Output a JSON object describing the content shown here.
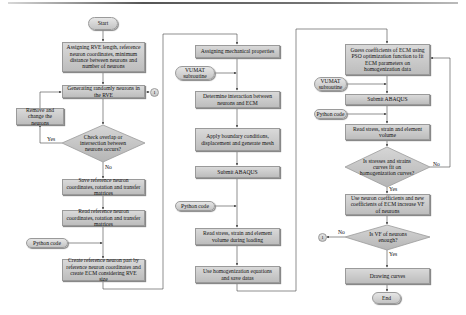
{
  "flowchart": {
    "column1": {
      "start": "Start",
      "assign_rve": "Assigning RVE length, reference neuron coordinates, minimum distance between neurons and number of neurons",
      "generate": "Generating randomly neurons in the RVE",
      "connector_out": "1",
      "remove_change": "Remove and change the neurons",
      "check_overlap": "Check overlap or intersection between neurons occurs?",
      "yes_label": "Yes",
      "no_label": "No",
      "save_ref": "Save reference neuron coordinates, rotation and transfer matrices",
      "read_ref": "Read reference neuron coordinates, rotation and transfer matrices",
      "python_code": "Python code",
      "create_part": "Create reference neuron part by reference neuron coordinates and create ECM considering RVE size"
    },
    "column2": {
      "assign_mech": "Assigning mechanical properties",
      "vumat": "VUMAT subroutine",
      "interaction": "Determine interaction between neurons and ECM",
      "boundary": "Apply boundary conditions, displacement and generate mesh",
      "submit": "Submit ABAQUS",
      "python_code": "Python code",
      "read_stress": "Read stress, strain and element volume during loading",
      "homogenization": "Use homogenization equations and save datas"
    },
    "column3": {
      "guess": "Guess coefficients of ECM using PSO optimization function to fit ECM parameters on homogenization data",
      "vumat": "VUMAT subroutine",
      "submit": "Submit ABAQUS",
      "python_code": "Python code",
      "read_stress": "Read stress, strain and element volume",
      "fit_check": "Is stresses and strains curves fit on homogenization curves?",
      "no_label": "No",
      "yes_label": "Yes",
      "use_coeff": "Use neuron coefficients and new coefficients of ECM increase VF of neurons",
      "vf_check": "Is VF of neurons enough?",
      "vf_no": "No",
      "vf_yes": "Yes",
      "connector_in": "1",
      "drawing": "Drawing curves",
      "end": "End"
    }
  }
}
